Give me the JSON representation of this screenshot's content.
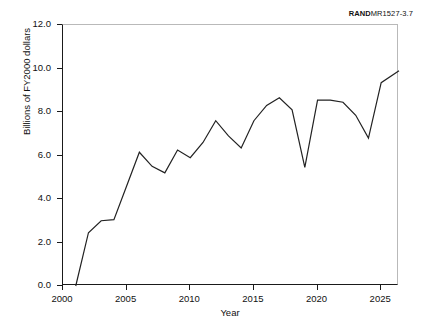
{
  "source_note": {
    "bold_part": "RAND",
    "rest_part": "MR1527-3.7"
  },
  "chart_data": {
    "type": "line",
    "title": "",
    "xlabel": "Year",
    "ylabel": "Billions of FY2000 dollars",
    "xlim": [
      2000,
      2026.4
    ],
    "ylim": [
      0.0,
      12.0
    ],
    "grid": false,
    "legend": "none",
    "x_ticks": [
      2000,
      2005,
      2010,
      2015,
      2020,
      2025
    ],
    "x_tick_labels": [
      "2000",
      "2005",
      "2010",
      "2015",
      "2020",
      "2025"
    ],
    "y_ticks": [
      0.0,
      2.0,
      4.0,
      6.0,
      8.0,
      10.0,
      12.0
    ],
    "y_tick_labels": [
      "0.0",
      "2.0",
      "4.0",
      "6.0",
      "8.0",
      "10.0",
      "12.0"
    ],
    "line_color": "#222222",
    "line_width": 1.2,
    "x": [
      2001,
      2002,
      2003,
      2004,
      2005,
      2006,
      2007,
      2008,
      2009,
      2010,
      2011,
      2012,
      2013,
      2014,
      2015,
      2016,
      2017,
      2018,
      2019,
      2020,
      2021,
      2022,
      2023,
      2024,
      2025,
      2026.4
    ],
    "values": [
      0.0,
      2.45,
      3.0,
      3.05,
      4.6,
      6.15,
      5.5,
      5.2,
      6.25,
      5.9,
      6.6,
      7.6,
      6.9,
      6.35,
      7.6,
      8.3,
      8.65,
      8.1,
      5.45,
      8.55,
      8.55,
      8.45,
      7.85,
      6.8,
      9.35,
      9.9
    ]
  }
}
